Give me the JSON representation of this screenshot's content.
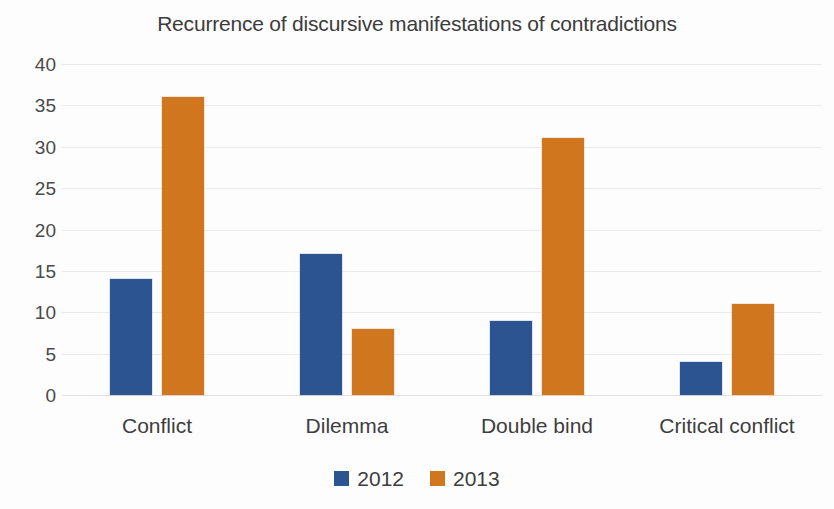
{
  "chart_data": {
    "type": "bar",
    "title": "Recurrence of discursive manifestations of contradictions",
    "xlabel": "",
    "ylabel": "",
    "categories": [
      "Conflict",
      "Dilemma",
      "Double bind",
      "Critical conflict"
    ],
    "series": [
      {
        "name": "2012",
        "color": "#2c5490",
        "values": [
          14,
          17,
          9,
          4
        ]
      },
      {
        "name": "2013",
        "color": "#d0761f",
        "values": [
          36,
          8,
          31,
          11
        ]
      }
    ],
    "ylim": [
      0,
      40
    ],
    "ytick_step": 5,
    "yticks": [
      "0",
      "5",
      "10",
      "15",
      "20",
      "25",
      "30",
      "35",
      "40"
    ],
    "grid": true,
    "legend_position": "bottom",
    "legend_entries": [
      "2012",
      "2013"
    ]
  }
}
